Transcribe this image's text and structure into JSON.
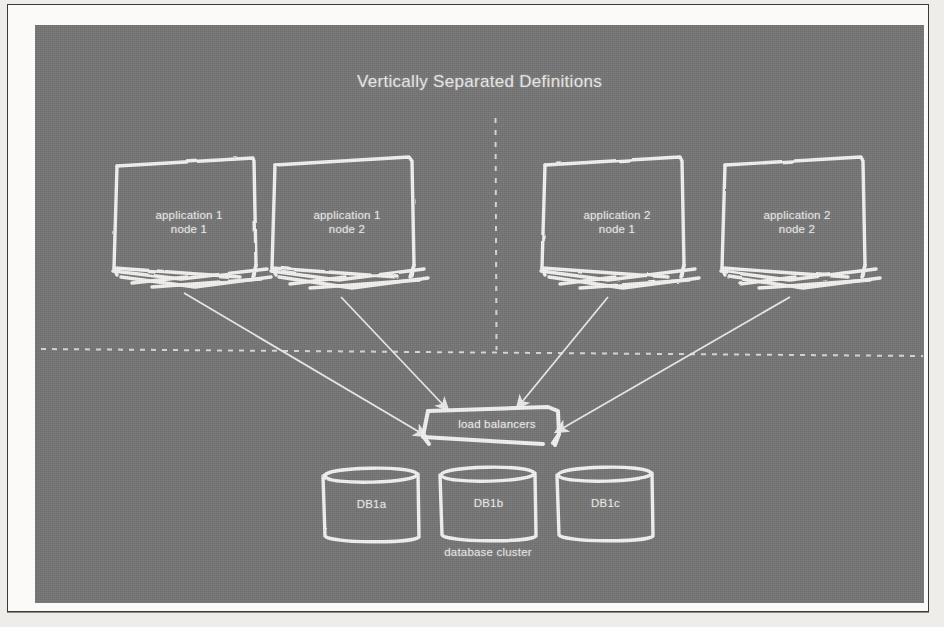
{
  "slide": {
    "title": "Vertically Separated Definitions",
    "background_color": "#757575",
    "ink_color": "#f0efed",
    "page_color": "#fbfaf8"
  },
  "nodes": [
    {
      "id": "app1-node1",
      "line1": "application 1",
      "line2": "node 1"
    },
    {
      "id": "app1-node2",
      "line1": "application 1",
      "line2": "node 2"
    },
    {
      "id": "app2-node1",
      "line1": "application 2",
      "line2": "node 1"
    },
    {
      "id": "app2-node2",
      "line1": "application 2",
      "line2": "node 2"
    }
  ],
  "load_balancer": {
    "label": "load balancers"
  },
  "databases": [
    {
      "id": "db1a",
      "label": "DB1a"
    },
    {
      "id": "db1b",
      "label": "DB1b"
    },
    {
      "id": "db1c",
      "label": "DB1c"
    }
  ],
  "cluster": {
    "label": "database cluster"
  },
  "dividers": {
    "vertical": "vertical-dashed-separator",
    "horizontal": "horizontal-dashed-separator"
  }
}
